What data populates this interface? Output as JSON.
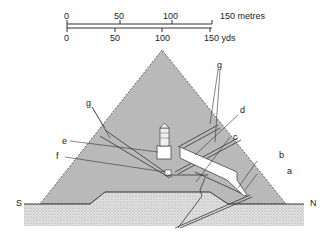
{
  "scale": {
    "metres": {
      "ticks": [
        "0",
        "50",
        "100",
        "150 metres"
      ]
    },
    "yards": {
      "ticks": [
        "0",
        "50",
        "100",
        "150 yds"
      ]
    }
  },
  "labels": {
    "a": "a",
    "b": "b",
    "c": "c",
    "d": "d",
    "e": "e",
    "f": "f",
    "g_left": "g",
    "g_right": "g",
    "south": "S",
    "north": "N"
  },
  "colors": {
    "pyramid": "#b9b9b9",
    "ground": "#d8d8d8",
    "passage": "#ffffff",
    "line": "#333333"
  }
}
